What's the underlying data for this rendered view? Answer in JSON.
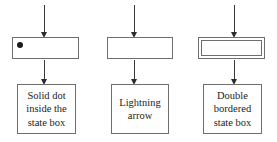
{
  "diagram": {
    "type": "uml-notation-legend",
    "background_color": "#ffffff",
    "line_color": "#6e6e6e",
    "arrow_color": "#2b2b2b",
    "text_color": "#1c1c1c",
    "columns": [
      {
        "id": "solid-dot",
        "state_box": {
          "style": "single-bordered",
          "marker": "solid-dot",
          "marker_position": "top-left"
        },
        "caption": "Solid dot\ninside the\nstate box",
        "caption_lines": [
          "Solid dot",
          "inside the",
          "state box"
        ],
        "top_arrow": "down-arrow",
        "bottom_arrow": "down-arrow"
      },
      {
        "id": "lightning-arrow",
        "state_box": {
          "style": "single-bordered",
          "marker": "none",
          "marker_position": ""
        },
        "caption": "Lightning\narrow",
        "caption_lines": [
          "Lightning",
          "arrow"
        ],
        "top_arrow": "down-arrow",
        "bottom_arrow": "down-arrow"
      },
      {
        "id": "double-bordered",
        "state_box": {
          "style": "double-bordered",
          "marker": "none",
          "marker_position": ""
        },
        "caption": "Double\nbordered\nstate box",
        "caption_lines": [
          "Double",
          "bordered",
          "state box"
        ],
        "top_arrow": "down-arrow",
        "bottom_arrow": "down-arrow"
      }
    ]
  }
}
